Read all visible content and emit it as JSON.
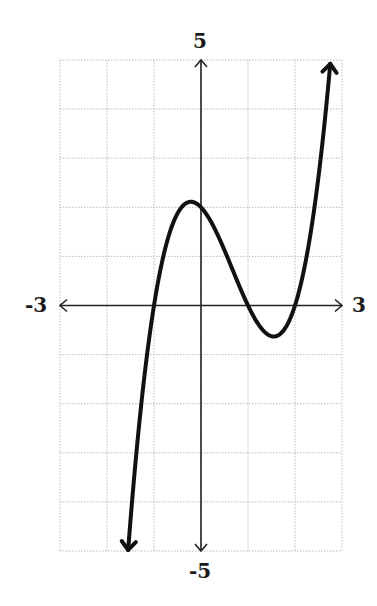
{
  "chart_data": {
    "type": "line",
    "title": "",
    "xlabel": "",
    "ylabel": "",
    "xlim": [
      -3,
      3
    ],
    "ylim": [
      -5,
      5
    ],
    "grid": true,
    "grid_step": {
      "x": 1,
      "y": 1
    },
    "tick_labels": {
      "x_min": "-3",
      "x_max": "3",
      "y_min": "-5",
      "y_max": "5"
    },
    "function": "f(x) = (x+1)(x-1)(x-2) = x^3 - 2x^2 - x + 2",
    "roots": [
      -1,
      1,
      2
    ],
    "y_intercept": 2,
    "local_max": {
      "x": -0.22,
      "y": 2.11
    },
    "local_min": {
      "x": 1.55,
      "y": -0.63
    },
    "series": [
      {
        "name": "f(x)",
        "x": [
          -1.55,
          -1.4,
          -1.2,
          -1.0,
          -0.8,
          -0.6,
          -0.4,
          -0.2,
          0.0,
          0.2,
          0.4,
          0.6,
          0.8,
          1.0,
          1.2,
          1.4,
          1.55,
          1.8,
          2.0,
          2.2,
          2.4,
          2.6,
          2.75
        ],
        "values": [
          -4.9,
          -3.82,
          -2.42,
          0.0,
          0.65,
          1.46,
          1.94,
          2.11,
          2.0,
          1.65,
          1.06,
          0.5,
          -0.02,
          0.0,
          -0.35,
          -0.58,
          -0.63,
          -0.45,
          0.0,
          0.29,
          1.64,
          3.25,
          4.71
        ]
      }
    ],
    "line_color": "#111111",
    "grid_color": "#bbbbbb"
  },
  "labels": {
    "y_top": "5",
    "y_bottom": "-5",
    "x_left": "-3",
    "x_right": "3"
  }
}
